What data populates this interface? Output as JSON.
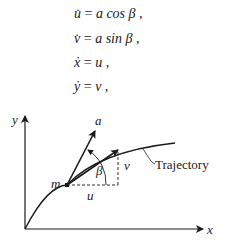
{
  "equations": [
    {
      "lhs": "u̇",
      "rhs": "a cos β ,"
    },
    {
      "lhs": "v̇",
      "rhs": "a sin β ,"
    },
    {
      "lhs": "ẋ",
      "rhs": "u ,"
    },
    {
      "lhs": "ẏ",
      "rhs": "v ,"
    }
  ],
  "diagram": {
    "axis_x_label": "x",
    "axis_y_label": "y",
    "mass_label": "m",
    "accel_label": "a",
    "angle_label": "β",
    "u_label": "u",
    "v_label": "v",
    "trajectory_label": "Trajectory"
  }
}
